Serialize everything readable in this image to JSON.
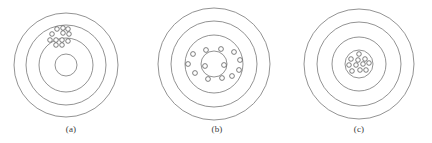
{
  "figure": {
    "background_color": "#ffffff",
    "ring_stroke_color": "#777777",
    "shot_stroke_color": "#4a4a4a",
    "shot_fill_color": "#ffffff",
    "width": 432,
    "height": 143
  },
  "panels": [
    {
      "id": "a",
      "caption": "(a)",
      "center": {
        "x": 66,
        "y": 65
      },
      "rings": [
        52,
        40,
        27
      ],
      "bullseye": 11,
      "shot_count": 12,
      "shot_radius": 2.3,
      "shots": [
        {
          "x": 57,
          "y": 29
        },
        {
          "x": 63,
          "y": 28
        },
        {
          "x": 68,
          "y": 29
        },
        {
          "x": 52,
          "y": 34
        },
        {
          "x": 63,
          "y": 33
        },
        {
          "x": 69,
          "y": 34
        },
        {
          "x": 50,
          "y": 40
        },
        {
          "x": 56,
          "y": 40
        },
        {
          "x": 62,
          "y": 40
        },
        {
          "x": 68,
          "y": 41
        },
        {
          "x": 56,
          "y": 45
        },
        {
          "x": 62,
          "y": 45
        }
      ]
    },
    {
      "id": "b",
      "caption": "(b)",
      "center": {
        "x": 214,
        "y": 64
      },
      "rings": [
        56,
        43,
        29
      ],
      "bullseye": 13,
      "shot_count": 13,
      "shot_radius": 2.4,
      "shots": [
        {
          "x": 206,
          "y": 50
        },
        {
          "x": 221,
          "y": 49
        },
        {
          "x": 234,
          "y": 52
        },
        {
          "x": 193,
          "y": 54
        },
        {
          "x": 240,
          "y": 60
        },
        {
          "x": 188,
          "y": 64
        },
        {
          "x": 205,
          "y": 66
        },
        {
          "x": 224,
          "y": 65
        },
        {
          "x": 239,
          "y": 70
        },
        {
          "x": 195,
          "y": 73
        },
        {
          "x": 232,
          "y": 76
        },
        {
          "x": 208,
          "y": 79
        },
        {
          "x": 222,
          "y": 78
        }
      ]
    },
    {
      "id": "c",
      "caption": "(c)",
      "center": {
        "x": 359,
        "y": 64
      },
      "rings": [
        55,
        42,
        27
      ],
      "bullseye": 14,
      "shot_count": 11,
      "shot_radius": 2.3,
      "shots": [
        {
          "x": 359,
          "y": 54
        },
        {
          "x": 351,
          "y": 59
        },
        {
          "x": 358,
          "y": 60
        },
        {
          "x": 365,
          "y": 59
        },
        {
          "x": 349,
          "y": 65
        },
        {
          "x": 356,
          "y": 65
        },
        {
          "x": 363,
          "y": 64
        },
        {
          "x": 369,
          "y": 63
        },
        {
          "x": 352,
          "y": 71
        },
        {
          "x": 360,
          "y": 70
        },
        {
          "x": 366,
          "y": 70
        }
      ]
    }
  ]
}
